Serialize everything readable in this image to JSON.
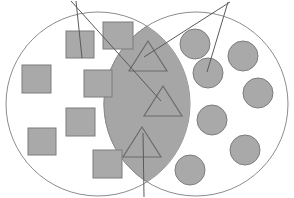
{
  "figure": {
    "name": "venn-diagram",
    "width": 294,
    "height": 198,
    "background": "#ffffff",
    "type": "venn-two-set"
  },
  "colors": {
    "circle_stroke": "#8c8c8c",
    "circle_fill": "#ffffff",
    "lens_fill": "#a6a6a6",
    "lens_stroke": "#8c8c8c",
    "square_fill": "#a9a9a9",
    "square_stroke": "#7d7d7d",
    "dot_fill": "#a9a9a9",
    "dot_stroke": "#7d7d7d",
    "triangle_fill": "none",
    "triangle_stroke": "#6b6b6b",
    "leader_line": "#5a5a5a",
    "clipped_text": "#bfbfbf"
  },
  "labels": {
    "left_top_clipped": "",
    "right_top_clipped": ""
  },
  "sets": {
    "left_circle": {
      "name": "left-set",
      "cx": 98,
      "cy": 104,
      "r": 92,
      "item_shape": "square",
      "item_count": 7
    },
    "right_circle": {
      "name": "right-set",
      "cx": 196,
      "cy": 104,
      "r": 92,
      "item_shape": "circle",
      "item_count": 7
    },
    "intersection": {
      "name": "intersection-lens",
      "item_shape": "triangle",
      "item_count": 3
    }
  },
  "squares": [
    {
      "x": 66,
      "y": 31,
      "w": 28,
      "h": 27
    },
    {
      "x": 103,
      "y": 22,
      "w": 30,
      "h": 27
    },
    {
      "x": 22,
      "y": 65,
      "w": 29,
      "h": 28
    },
    {
      "x": 84,
      "y": 70,
      "w": 28,
      "h": 27
    },
    {
      "x": 66,
      "y": 108,
      "w": 29,
      "h": 28
    },
    {
      "x": 28,
      "y": 128,
      "w": 28,
      "h": 27
    },
    {
      "x": 93,
      "y": 150,
      "w": 29,
      "h": 28
    }
  ],
  "dots": [
    {
      "cx": 195,
      "cy": 44,
      "r": 15
    },
    {
      "cx": 243,
      "cy": 56,
      "r": 15
    },
    {
      "cx": 208,
      "cy": 73,
      "r": 15
    },
    {
      "cx": 258,
      "cy": 93,
      "r": 15
    },
    {
      "cx": 212,
      "cy": 120,
      "r": 15
    },
    {
      "cx": 245,
      "cy": 150,
      "r": 15
    },
    {
      "cx": 190,
      "cy": 170,
      "r": 15
    }
  ],
  "triangles": [
    {
      "cx": 148,
      "cy": 56,
      "half_w": 19,
      "h": 30
    },
    {
      "cx": 163,
      "cy": 101,
      "half_w": 19,
      "h": 30
    },
    {
      "cx": 142,
      "cy": 142,
      "half_w": 19,
      "h": 30
    }
  ],
  "leader_lines": [
    {
      "name": "leader-left-to-square",
      "x1": 76,
      "y1": 1,
      "x2": 82,
      "y2": 58
    },
    {
      "name": "leader-left-to-lens",
      "x1": 71,
      "y1": 1,
      "x2": 161,
      "y2": 101
    },
    {
      "name": "leader-right-to-dot",
      "x1": 228,
      "y1": 2,
      "x2": 207,
      "y2": 72
    },
    {
      "name": "leader-right-to-lens",
      "x1": 230,
      "y1": 2,
      "x2": 144,
      "y2": 57
    },
    {
      "name": "leader-bottom-to-triangle",
      "x1": 144,
      "y1": 197,
      "x2": 143,
      "y2": 133
    }
  ]
}
